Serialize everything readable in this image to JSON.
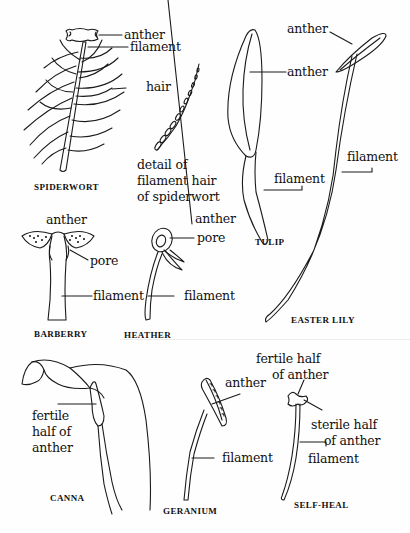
{
  "figure": {
    "type": "botanical stamen diagram",
    "specimens": [
      {
        "id": "spiderwort",
        "name": "SPIDERWORT",
        "labels": [
          "anther",
          "filament",
          "hair"
        ]
      },
      {
        "id": "spiderwort-hair-detail",
        "caption_lines": [
          "detail of",
          "filament hair",
          "of spiderwort"
        ]
      },
      {
        "id": "tulip",
        "name": "TULIP",
        "labels": [
          "anther",
          "filament"
        ]
      },
      {
        "id": "easter-lily",
        "name": "EASTER  LILY",
        "labels": [
          "anther",
          "filament"
        ]
      },
      {
        "id": "barberry",
        "name": "BARBERRY",
        "labels": [
          "anther",
          "pore",
          "filament"
        ]
      },
      {
        "id": "heather",
        "name": "HEATHER",
        "labels": [
          "anther",
          "pore",
          "filament"
        ]
      },
      {
        "id": "canna",
        "name": "CANNA",
        "labels": [
          "fertile",
          "half of",
          "anther"
        ]
      },
      {
        "id": "geranium",
        "name": "GERANIUM",
        "labels": [
          "anther",
          "filament"
        ]
      },
      {
        "id": "self-heal",
        "name": "SELF-HEAL",
        "labels": [
          "fertile half",
          "of anther",
          "sterile half",
          "of anther",
          "filament"
        ]
      }
    ]
  }
}
